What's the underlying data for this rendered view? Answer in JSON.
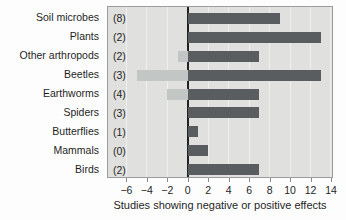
{
  "chart_data": {
    "type": "bar",
    "orientation": "horizontal",
    "title": "",
    "xlabel": "Studies showing negative or positive effects",
    "categories": [
      "Soil microbes",
      "Plants",
      "Other arthropods",
      "Beetles",
      "Earthworms",
      "Spiders",
      "Butterflies",
      "Mammals",
      "Birds"
    ],
    "count_labels": [
      "(8)",
      "(2)",
      "(2)",
      "(3)",
      "(4)",
      "(3)",
      "(1)",
      "(0)",
      "(2)"
    ],
    "series": [
      {
        "name": "negative-effect-studies",
        "values": [
          0,
          0,
          -1,
          -5,
          -2,
          0,
          0,
          0,
          0
        ]
      },
      {
        "name": "positive-effect-studies",
        "values": [
          9,
          13,
          7,
          13,
          7,
          7,
          1,
          2,
          7
        ]
      }
    ],
    "xlim": [
      -7.8,
      14.1
    ],
    "xticks": [
      -6,
      -4,
      -2,
      0,
      2,
      4,
      6,
      8,
      10,
      12,
      14
    ],
    "xtick_labels": [
      "−6",
      "−4",
      "−2",
      "0",
      "2",
      "4",
      "6",
      "8",
      "10",
      "12",
      "14"
    ],
    "grid": true,
    "zero_line": true,
    "legend": "none"
  },
  "colors": {
    "positive_bar": "#595d60",
    "negative_bar": "#c2c6c4",
    "plot_background": "#e0e1df",
    "plot_border": "#9c9c9a",
    "gridline": "#efefed",
    "zero_line": "#222222",
    "text": "#1f1f1f"
  }
}
